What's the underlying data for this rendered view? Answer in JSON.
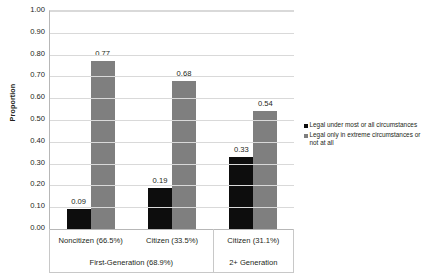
{
  "chart_data": {
    "type": "bar",
    "title": "",
    "xlabel": "",
    "ylabel": "Proportion",
    "ylim": [
      0,
      1
    ],
    "ytick_step": 0.1,
    "grid": true,
    "legend_position": "right",
    "categories": [
      "Noncitizen (66.5%)",
      "Citizen (33.5%)",
      "Citizen (31.1%)"
    ],
    "group_labels": [
      "First-Generation (68.9%)",
      "2+ Generation"
    ],
    "series": [
      {
        "name": "Legal under most or all circumstances",
        "color": "#0d0d0d",
        "values": [
          0.09,
          0.19,
          0.33
        ],
        "labels": [
          "0.09",
          "0.19",
          "0.33"
        ]
      },
      {
        "name": "Legal only in extreme circumstances or not at all",
        "color": "#7f7f7f",
        "values": [
          0.77,
          0.68,
          0.54
        ],
        "labels": [
          "0.77",
          "0.68",
          "0.54"
        ]
      }
    ],
    "ytick_labels": [
      "1.00",
      "0.90",
      "0.80",
      "0.70",
      "0.60",
      "0.50",
      "0.40",
      "0.30",
      "0.20",
      "0.10",
      "0.00"
    ]
  },
  "axis": {
    "y_title": "Proportion"
  },
  "legend": {
    "items": [
      {
        "label": "Legal under most or all circumstances"
      },
      {
        "label": "Legal only in extreme circumstances or not at all"
      }
    ]
  }
}
